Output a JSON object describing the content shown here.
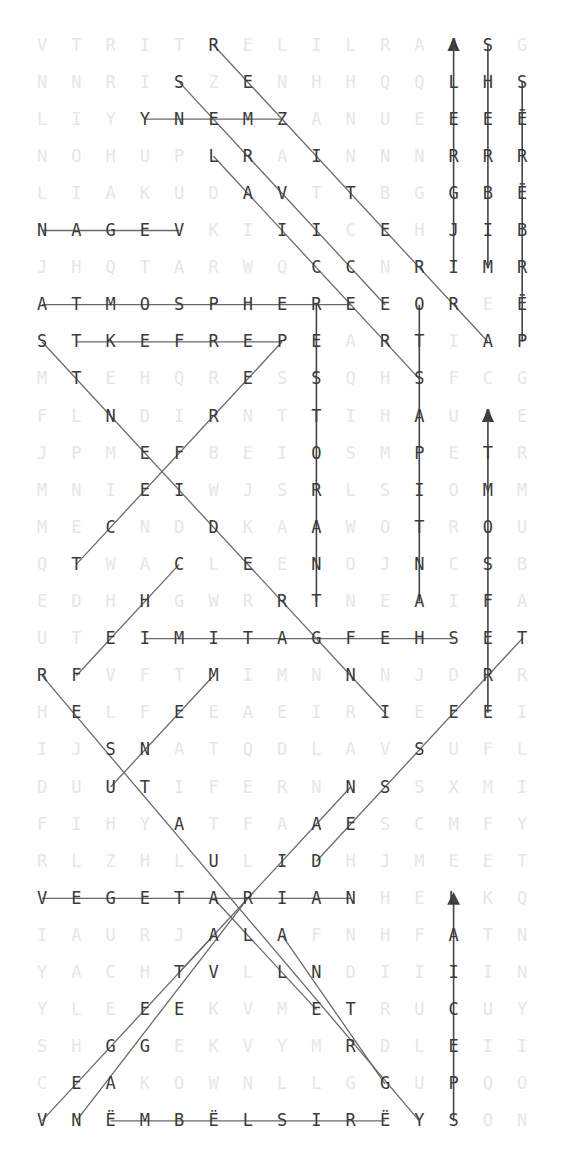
{
  "puzzle": {
    "type": "word-search",
    "rows": 30,
    "cols": 15,
    "origin_x": 42,
    "origin_y": 45,
    "pitch_x": 34.3,
    "pitch_y": 37.1,
    "grid": [
      [
        "V",
        "T",
        "R",
        "I",
        "T",
        "R",
        "E",
        "L",
        "I",
        "L",
        "R",
        "A",
        "A",
        "S",
        "G"
      ],
      [
        "N",
        "N",
        "R",
        "I",
        "S",
        "Z",
        "E",
        "N",
        "H",
        "H",
        "Q",
        "Q",
        "L",
        "H",
        "S"
      ],
      [
        "L",
        "I",
        "Y",
        "Y",
        "N",
        "E",
        "M",
        "Z",
        "A",
        "N",
        "U",
        "E",
        "E",
        "E",
        "Ë"
      ],
      [
        "N",
        "O",
        "H",
        "U",
        "P",
        "L",
        "R",
        "A",
        "I",
        "N",
        "N",
        "N",
        "R",
        "R",
        "R"
      ],
      [
        "L",
        "I",
        "A",
        "K",
        "U",
        "D",
        "A",
        "V",
        "T",
        "T",
        "B",
        "G",
        "G",
        "B",
        "Ë"
      ],
      [
        "N",
        "A",
        "G",
        "E",
        "V",
        "K",
        "I",
        "I",
        "I",
        "C",
        "E",
        "H",
        "J",
        "I",
        "B"
      ],
      [
        "J",
        "H",
        "Q",
        "T",
        "A",
        "R",
        "W",
        "Q",
        "C",
        "C",
        "N",
        "R",
        "I",
        "M",
        "R"
      ],
      [
        "A",
        "T",
        "M",
        "O",
        "S",
        "P",
        "H",
        "E",
        "R",
        "E",
        "E",
        "O",
        "R",
        "E",
        "Ë"
      ],
      [
        "S",
        "T",
        "K",
        "E",
        "F",
        "R",
        "E",
        "P",
        "E",
        "A",
        "R",
        "T",
        "I",
        "A",
        "P"
      ],
      [
        "M",
        "T",
        "E",
        "H",
        "Q",
        "R",
        "E",
        "S",
        "S",
        "Q",
        "H",
        "S",
        "F",
        "C",
        "G"
      ],
      [
        "F",
        "L",
        "N",
        "D",
        "I",
        "R",
        "N",
        "T",
        "T",
        "I",
        "H",
        "A",
        "U",
        "A",
        "E"
      ],
      [
        "J",
        "P",
        "M",
        "E",
        "F",
        "B",
        "E",
        "I",
        "O",
        "S",
        "M",
        "P",
        "E",
        "T",
        "R"
      ],
      [
        "M",
        "N",
        "I",
        "E",
        "I",
        "W",
        "J",
        "S",
        "R",
        "L",
        "S",
        "I",
        "O",
        "M",
        "M"
      ],
      [
        "M",
        "E",
        "C",
        "N",
        "D",
        "D",
        "K",
        "A",
        "A",
        "W",
        "O",
        "T",
        "R",
        "O",
        "U"
      ],
      [
        "Q",
        "T",
        "W",
        "A",
        "C",
        "L",
        "E",
        "E",
        "N",
        "O",
        "J",
        "N",
        "C",
        "S",
        "B"
      ],
      [
        "E",
        "D",
        "H",
        "H",
        "G",
        "W",
        "R",
        "R",
        "T",
        "N",
        "E",
        "A",
        "I",
        "F",
        "A"
      ],
      [
        "U",
        "T",
        "E",
        "I",
        "M",
        "I",
        "T",
        "A",
        "G",
        "F",
        "E",
        "H",
        "S",
        "E",
        "T"
      ],
      [
        "R",
        "F",
        "V",
        "F",
        "T",
        "M",
        "I",
        "M",
        "N",
        "N",
        "N",
        "J",
        "D",
        "R",
        "R"
      ],
      [
        "H",
        "E",
        "L",
        "F",
        "E",
        "E",
        "A",
        "E",
        "I",
        "R",
        "I",
        "E",
        "E",
        "E",
        "I"
      ],
      [
        "I",
        "J",
        "S",
        "N",
        "A",
        "T",
        "Q",
        "D",
        "L",
        "A",
        "V",
        "S",
        "U",
        "F",
        "L"
      ],
      [
        "D",
        "U",
        "U",
        "T",
        "I",
        "F",
        "E",
        "R",
        "N",
        "N",
        "S",
        "S",
        "X",
        "M",
        "I"
      ],
      [
        "F",
        "I",
        "H",
        "Y",
        "A",
        "T",
        "F",
        "A",
        "A",
        "E",
        "S",
        "C",
        "M",
        "F",
        "Y"
      ],
      [
        "R",
        "L",
        "Z",
        "H",
        "L",
        "U",
        "L",
        "I",
        "D",
        "H",
        "J",
        "M",
        "E",
        "E",
        "T"
      ],
      [
        "V",
        "E",
        "G",
        "E",
        "T",
        "A",
        "R",
        "I",
        "A",
        "N",
        "H",
        "E",
        "L",
        "K",
        "Q"
      ],
      [
        "I",
        "A",
        "U",
        "R",
        "J",
        "A",
        "L",
        "A",
        "F",
        "N",
        "H",
        "F",
        "A",
        "T",
        "N"
      ],
      [
        "Y",
        "A",
        "C",
        "H",
        "T",
        "V",
        "L",
        "L",
        "N",
        "D",
        "I",
        "I",
        "I",
        "I",
        "N"
      ],
      [
        "Y",
        "L",
        "E",
        "E",
        "E",
        "K",
        "V",
        "M",
        "E",
        "T",
        "R",
        "U",
        "C",
        "U",
        "Y"
      ],
      [
        "S",
        "H",
        "G",
        "G",
        "E",
        "K",
        "V",
        "Y",
        "M",
        "R",
        "D",
        "L",
        "E",
        "I",
        "I"
      ],
      [
        "C",
        "E",
        "A",
        "K",
        "O",
        "W",
        "N",
        "L",
        "L",
        "G",
        "G",
        "U",
        "P",
        "Q",
        "O"
      ],
      [
        "V",
        "N",
        "Ë",
        "M",
        "B",
        "Ë",
        "L",
        "S",
        "I",
        "R",
        "Ë",
        "Y",
        "S",
        "O",
        "N"
      ]
    ],
    "found_cells": [
      [
        0,
        5
      ],
      [
        0,
        12
      ],
      [
        0,
        13
      ],
      [
        1,
        4
      ],
      [
        1,
        6
      ],
      [
        1,
        12
      ],
      [
        1,
        13
      ],
      [
        1,
        14
      ],
      [
        2,
        3
      ],
      [
        2,
        4
      ],
      [
        2,
        5
      ],
      [
        2,
        6
      ],
      [
        2,
        7
      ],
      [
        2,
        12
      ],
      [
        2,
        13
      ],
      [
        2,
        14
      ],
      [
        3,
        5
      ],
      [
        3,
        6
      ],
      [
        3,
        8
      ],
      [
        3,
        12
      ],
      [
        3,
        13
      ],
      [
        3,
        14
      ],
      [
        4,
        6
      ],
      [
        4,
        7
      ],
      [
        4,
        9
      ],
      [
        4,
        12
      ],
      [
        4,
        13
      ],
      [
        4,
        14
      ],
      [
        5,
        0
      ],
      [
        5,
        1
      ],
      [
        5,
        2
      ],
      [
        5,
        3
      ],
      [
        5,
        4
      ],
      [
        5,
        7
      ],
      [
        5,
        8
      ],
      [
        5,
        10
      ],
      [
        5,
        12
      ],
      [
        5,
        13
      ],
      [
        5,
        14
      ],
      [
        6,
        8
      ],
      [
        6,
        9
      ],
      [
        6,
        11
      ],
      [
        6,
        12
      ],
      [
        6,
        13
      ],
      [
        6,
        14
      ],
      [
        7,
        0
      ],
      [
        7,
        1
      ],
      [
        7,
        2
      ],
      [
        7,
        3
      ],
      [
        7,
        4
      ],
      [
        7,
        5
      ],
      [
        7,
        6
      ],
      [
        7,
        7
      ],
      [
        7,
        8
      ],
      [
        7,
        9
      ],
      [
        7,
        10
      ],
      [
        7,
        11
      ],
      [
        7,
        12
      ],
      [
        7,
        14
      ],
      [
        8,
        0
      ],
      [
        8,
        1
      ],
      [
        8,
        2
      ],
      [
        8,
        3
      ],
      [
        8,
        4
      ],
      [
        8,
        5
      ],
      [
        8,
        6
      ],
      [
        8,
        7
      ],
      [
        8,
        8
      ],
      [
        8,
        10
      ],
      [
        8,
        11
      ],
      [
        8,
        13
      ],
      [
        8,
        14
      ],
      [
        9,
        1
      ],
      [
        9,
        6
      ],
      [
        9,
        8
      ],
      [
        9,
        11
      ],
      [
        10,
        2
      ],
      [
        10,
        5
      ],
      [
        10,
        8
      ],
      [
        10,
        11
      ],
      [
        10,
        13
      ],
      [
        11,
        3
      ],
      [
        11,
        4
      ],
      [
        11,
        8
      ],
      [
        11,
        11
      ],
      [
        11,
        13
      ],
      [
        12,
        3
      ],
      [
        12,
        4
      ],
      [
        12,
        8
      ],
      [
        12,
        11
      ],
      [
        12,
        13
      ],
      [
        13,
        2
      ],
      [
        13,
        5
      ],
      [
        13,
        8
      ],
      [
        13,
        11
      ],
      [
        13,
        13
      ],
      [
        14,
        1
      ],
      [
        14,
        4
      ],
      [
        14,
        6
      ],
      [
        14,
        8
      ],
      [
        14,
        11
      ],
      [
        14,
        13
      ],
      [
        15,
        3
      ],
      [
        15,
        7
      ],
      [
        15,
        8
      ],
      [
        15,
        11
      ],
      [
        15,
        13
      ],
      [
        16,
        2
      ],
      [
        16,
        3
      ],
      [
        16,
        4
      ],
      [
        16,
        5
      ],
      [
        16,
        6
      ],
      [
        16,
        7
      ],
      [
        16,
        8
      ],
      [
        16,
        9
      ],
      [
        16,
        10
      ],
      [
        16,
        11
      ],
      [
        16,
        12
      ],
      [
        16,
        13
      ],
      [
        16,
        14
      ],
      [
        17,
        0
      ],
      [
        17,
        1
      ],
      [
        17,
        5
      ],
      [
        17,
        9
      ],
      [
        17,
        13
      ],
      [
        18,
        1
      ],
      [
        18,
        4
      ],
      [
        18,
        10
      ],
      [
        18,
        12
      ],
      [
        18,
        13
      ],
      [
        19,
        2
      ],
      [
        19,
        3
      ],
      [
        19,
        11
      ],
      [
        20,
        2
      ],
      [
        20,
        3
      ],
      [
        20,
        9
      ],
      [
        20,
        10
      ],
      [
        21,
        4
      ],
      [
        21,
        8
      ],
      [
        21,
        9
      ],
      [
        22,
        5
      ],
      [
        22,
        7
      ],
      [
        22,
        8
      ],
      [
        23,
        0
      ],
      [
        23,
        1
      ],
      [
        23,
        2
      ],
      [
        23,
        3
      ],
      [
        23,
        4
      ],
      [
        23,
        5
      ],
      [
        23,
        6
      ],
      [
        23,
        7
      ],
      [
        23,
        8
      ],
      [
        23,
        9
      ],
      [
        23,
        12
      ],
      [
        24,
        5
      ],
      [
        24,
        6
      ],
      [
        24,
        7
      ],
      [
        24,
        12
      ],
      [
        25,
        4
      ],
      [
        25,
        5
      ],
      [
        25,
        7
      ],
      [
        25,
        8
      ],
      [
        25,
        12
      ],
      [
        26,
        3
      ],
      [
        26,
        4
      ],
      [
        26,
        8
      ],
      [
        26,
        9
      ],
      [
        26,
        12
      ],
      [
        27,
        2
      ],
      [
        27,
        3
      ],
      [
        27,
        9
      ],
      [
        27,
        12
      ],
      [
        28,
        1
      ],
      [
        28,
        2
      ],
      [
        28,
        10
      ],
      [
        28,
        12
      ],
      [
        29,
        0
      ],
      [
        29,
        1
      ],
      [
        29,
        2
      ],
      [
        29,
        3
      ],
      [
        29,
        4
      ],
      [
        29,
        5
      ],
      [
        29,
        6
      ],
      [
        29,
        7
      ],
      [
        29,
        8
      ],
      [
        29,
        9
      ],
      [
        29,
        10
      ],
      [
        29,
        11
      ],
      [
        29,
        12
      ]
    ],
    "lines": [
      {
        "word": "YNEMZ",
        "from": [
          2,
          3
        ],
        "to": [
          2,
          7
        ],
        "arrow": false
      },
      {
        "word": "NAGEV",
        "from": [
          5,
          0
        ],
        "to": [
          5,
          4
        ],
        "arrow": false
      },
      {
        "word": "ATMOSPHERE",
        "from": [
          7,
          0
        ],
        "to": [
          7,
          9
        ],
        "arrow": false
      },
      {
        "word": "TKEFREP",
        "from": [
          8,
          1
        ],
        "to": [
          8,
          7
        ],
        "arrow": false
      },
      {
        "word": "IMITAGFEHS",
        "from": [
          16,
          3
        ],
        "to": [
          16,
          12
        ],
        "arrow": false
      },
      {
        "word": "VEGETARIAN",
        "from": [
          23,
          0
        ],
        "to": [
          23,
          9
        ],
        "arrow": false
      },
      {
        "word": "ËMBËLSIRË",
        "from": [
          29,
          2
        ],
        "to": [
          29,
          10
        ],
        "arrow": false
      },
      {
        "word": "ALERGJI",
        "from": [
          6,
          12
        ],
        "to": [
          0,
          12
        ],
        "arrow": true
      },
      {
        "word": "SHERBIM",
        "from": [
          0,
          13
        ],
        "to": [
          6,
          13
        ],
        "arrow": false
      },
      {
        "word": "SËRËBRËP",
        "from": [
          1,
          14
        ],
        "to": [
          8,
          14
        ],
        "arrow": false
      },
      {
        "word": "RESTORANT",
        "from": [
          7,
          8
        ],
        "to": [
          15,
          8
        ],
        "arrow": false
      },
      {
        "word": "ANTIPASTO",
        "from": [
          15,
          11
        ],
        "to": [
          7,
          11
        ],
        "arrow": false
      },
      {
        "word": "TEFSOMTA",
        "from": [
          17,
          13
        ],
        "to": [
          10,
          13
        ],
        "arrow": true
      },
      {
        "word": "RE",
        "from": [
          17,
          13
        ],
        "to": [
          18,
          13
        ],
        "arrow": false
      },
      {
        "word": "SPECIAL",
        "from": [
          27,
          12
        ],
        "to": [
          23,
          12
        ],
        "arrow": true
      },
      {
        "word": "SPECIAL_TAIL",
        "from": [
          29,
          12
        ],
        "to": [
          27,
          12
        ],
        "arrow": false
      },
      {
        "word": "REZITERRA",
        "from": [
          0,
          5
        ],
        "to": [
          8,
          13
        ],
        "arrow": false
      },
      {
        "word": "SERVICE",
        "from": [
          1,
          4
        ],
        "to": [
          7,
          10
        ],
        "arrow": false
      },
      {
        "word": "LAICERS",
        "from": [
          3,
          5
        ],
        "to": [
          9,
          11
        ],
        "arrow": false
      },
      {
        "word": "STNEIDERGN",
        "from": [
          8,
          0
        ],
        "to": [
          18,
          10
        ],
        "arrow": false
      },
      {
        "word": "PERFECT",
        "from": [
          8,
          7
        ],
        "to": [
          14,
          1
        ],
        "arrow": false
      },
      {
        "word": "CHEF",
        "from": [
          14,
          4
        ],
        "to": [
          17,
          1
        ],
        "arrow": false
      },
      {
        "word": "RESTAURANT",
        "from": [
          17,
          0
        ],
        "to": [
          29,
          11
        ],
        "arrow": false
      },
      {
        "word": "MENU",
        "from": [
          17,
          5
        ],
        "to": [
          20,
          2
        ],
        "arrow": false
      },
      {
        "word": "TRESSED",
        "from": [
          16,
          14
        ],
        "to": [
          22,
          8
        ],
        "arrow": false
      },
      {
        "word": "NAIRAV",
        "from": [
          20,
          9
        ],
        "to": [
          25,
          4
        ],
        "arrow": false
      },
      {
        "word": "AVEGE",
        "from": [
          24,
          5
        ],
        "to": [
          29,
          0
        ],
        "arrow": false
      },
      {
        "word": "RAVGAN",
        "from": [
          23,
          6
        ],
        "to": [
          29,
          1
        ],
        "arrow": false
      },
      {
        "word": "ALLE",
        "from": [
          23,
          5
        ],
        "to": [
          26,
          8
        ],
        "arrow": false
      },
      {
        "word": "ANTRG",
        "from": [
          24,
          7
        ],
        "to": [
          28,
          10
        ],
        "arrow": false
      }
    ],
    "colors": {
      "background": "#ffffff",
      "found_letter": "#3a3a3a",
      "filler_letter": "#e6e6e6",
      "strike_line": "#6a6a6a"
    }
  }
}
